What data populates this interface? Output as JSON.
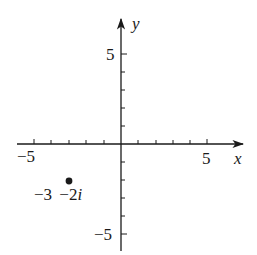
{
  "diagram": {
    "type": "complex-plane",
    "colors": {
      "ink": "#1a1a1a",
      "background": "#ffffff"
    },
    "axes": {
      "x": {
        "name": "x",
        "min": -5.5,
        "max": 6.5,
        "tick_step": 1,
        "labeled_ticks": [
          {
            "value": -5,
            "label": "−5"
          },
          {
            "value": 5,
            "label": "5"
          }
        ]
      },
      "y": {
        "name": "y",
        "min": -6,
        "max": 7,
        "tick_step": 1,
        "labeled_ticks": [
          {
            "value": 5,
            "label": "5"
          },
          {
            "value": -5,
            "label": "−5"
          }
        ]
      }
    },
    "points": [
      {
        "re": -3,
        "im": -2,
        "label_real": "−3",
        "label_imag": "−2",
        "label_imag_unit": "i"
      }
    ]
  }
}
